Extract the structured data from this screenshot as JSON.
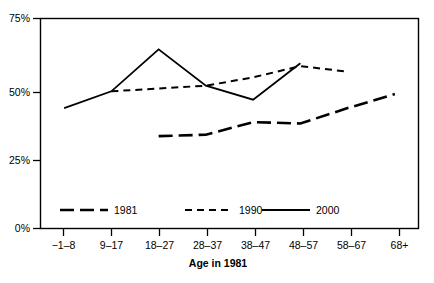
{
  "chart_data": {
    "type": "line",
    "title": "",
    "xlabel": "Age in 1981",
    "ylabel": "",
    "categories": [
      "−1–8",
      "9–17",
      "18–27",
      "28–37",
      "38–47",
      "48–57",
      "58–67",
      "68+"
    ],
    "ylim": [
      0,
      75
    ],
    "ytick_values": [
      0,
      25,
      50,
      75
    ],
    "ytick_labels": [
      "0%",
      "25%",
      "50%",
      "75%"
    ],
    "grid": false,
    "legend_position": "inside-bottom-left",
    "series": [
      {
        "name": "1981",
        "style": "long-dash",
        "color": "#000000",
        "values": [
          null,
          null,
          33.0,
          33.5,
          38.0,
          37.5,
          43.0,
          48.0
        ]
      },
      {
        "name": "1990",
        "style": "short-dash",
        "color": "#000000",
        "values": [
          null,
          49.0,
          50.0,
          51.0,
          54.0,
          58.0,
          56.0,
          null
        ]
      },
      {
        "name": "2000",
        "style": "solid",
        "color": "#000000",
        "values": [
          43.0,
          49.0,
          64.0,
          51.0,
          46.0,
          59.0,
          null,
          null
        ]
      }
    ]
  },
  "axes": {
    "y_labels": [
      "75%",
      "50%",
      "25%",
      "0%"
    ],
    "x_labels": [
      "−1–8",
      "9–17",
      "18–27",
      "28–37",
      "38–47",
      "48–57",
      "58–67",
      "68+"
    ],
    "x_title": "Age in 1981"
  },
  "legend": {
    "entries": [
      {
        "label": "1981",
        "style": "long-dash"
      },
      {
        "label": "1990",
        "style": "short-dash"
      },
      {
        "label": "2000",
        "style": "solid"
      }
    ]
  }
}
